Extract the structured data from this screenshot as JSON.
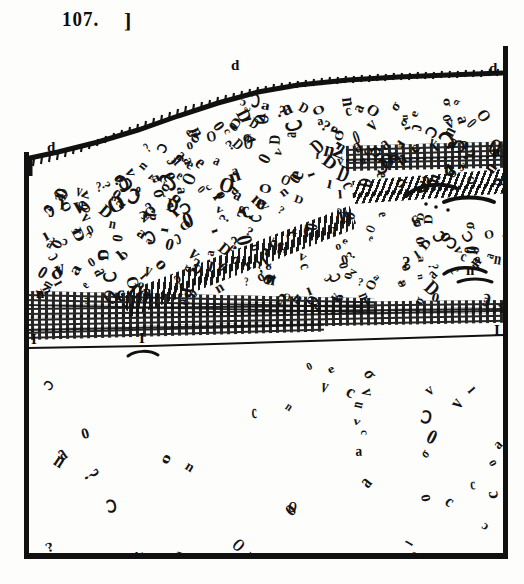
{
  "plate": {
    "number": "107.",
    "bracket": "]"
  },
  "figure": {
    "background_color": "#fdfdfc",
    "ink_color": "#111111",
    "frame": {
      "left_label": "left-border",
      "right_label": "right-border",
      "bottom_label": "bottom-border"
    }
  },
  "annotations": [
    {
      "id": "d-top-left",
      "label": "d",
      "x": 47,
      "y": 139
    },
    {
      "id": "d-ridge",
      "label": "d",
      "x": 231,
      "y": 57
    },
    {
      "id": "d-top-right",
      "label": "d",
      "x": 489,
      "y": 60
    },
    {
      "id": "n-right-upper",
      "label": "n",
      "x": 492,
      "y": 143
    },
    {
      "id": "n-left-mid",
      "label": "n",
      "x": 36,
      "y": 285
    },
    {
      "id": "n-center-mid",
      "label": "n",
      "x": 143,
      "y": 283
    },
    {
      "id": "n-right-mid",
      "label": "n",
      "x": 466,
      "y": 262
    },
    {
      "id": "i-left-base",
      "label": "I",
      "x": 31,
      "y": 331
    },
    {
      "id": "i-center-base",
      "label": "I",
      "x": 139,
      "y": 330
    },
    {
      "id": "i-right-base",
      "label": "I",
      "x": 494,
      "y": 322
    }
  ],
  "beds": [
    {
      "id": "upper-conglomerate",
      "name": "Upper conglomerate bed",
      "pattern": "pebble-ovals",
      "density": "high"
    },
    {
      "id": "upper-stipple-band",
      "name": "Upper stippled sand band",
      "pattern": "stipple-dashes"
    },
    {
      "id": "diagonal-band",
      "name": "Inclined stippled band",
      "pattern": "hatched-dashes"
    },
    {
      "id": "mid-conglomerate",
      "name": "Middle conglomerate bed",
      "pattern": "pebble-ovals",
      "density": "medium"
    },
    {
      "id": "lower-stipple-band",
      "name": "Lower stippled sand band",
      "pattern": "stipple-dashes"
    },
    {
      "id": "basal-bed",
      "name": "Basal sparse pebble bed",
      "pattern": "pebble-ovals",
      "density": "low"
    }
  ],
  "pebble_glyphs": [
    "o",
    "O",
    "0",
    "c",
    "n",
    "a",
    "ɔ",
    "σ",
    "D",
    "v",
    "e",
    "ı",
    "?",
    "Ↄ"
  ],
  "chart_data": {
    "type": "diagram",
    "layers": [
      {
        "name": "Upper conglomerate (d)",
        "position": "above upper band"
      },
      {
        "name": "Upper stippled band (n)",
        "position": "middle upper"
      },
      {
        "name": "Inclined band",
        "position": "diagonal, rising left to right"
      },
      {
        "name": "Middle conglomerate",
        "position": "below inclined band"
      },
      {
        "name": "Lower stippled band (n-I)",
        "position": "lower middle"
      },
      {
        "name": "Basal bed (I)",
        "position": "bottom"
      }
    ]
  }
}
